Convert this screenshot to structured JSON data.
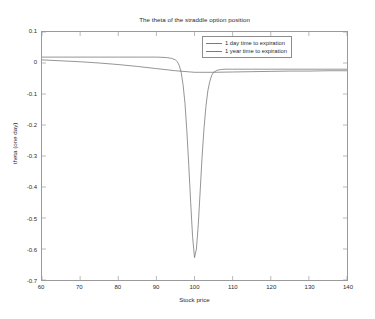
{
  "chart_data": {
    "type": "line",
    "title": "The theta of the straddle option position",
    "xlabel": "Stock price",
    "ylabel": "theta (one day)",
    "xlim": [
      60,
      140
    ],
    "ylim": [
      -0.7,
      0.1
    ],
    "xticks": [
      60,
      70,
      80,
      90,
      100,
      110,
      120,
      130,
      140
    ],
    "xtick_labels": [
      "60",
      "70",
      "80",
      "90",
      "100",
      "110",
      "120",
      "130",
      "140"
    ],
    "yticks": [
      0.1,
      0,
      -0.1,
      -0.2,
      -0.3,
      -0.4,
      -0.5,
      -0.6,
      -0.7
    ],
    "ytick_labels": [
      "0.1",
      "0",
      "-0.1",
      "-0.2",
      "-0.3",
      "-0.4",
      "-0.5",
      "-0.6",
      "-0.7"
    ],
    "grid": false,
    "legend_position": "top-right",
    "line_color": "#7a7a7a",
    "axis_color": "#9a9a9a",
    "background_color": "#ffffff",
    "series": [
      {
        "name": "1 day time to expiration",
        "color": "#7a7a7a",
        "x": [
          60,
          65,
          70,
          75,
          80,
          85,
          88,
          90,
          92,
          93,
          94,
          95,
          95.5,
          96,
          96.5,
          97,
          97.5,
          98,
          98.5,
          99,
          99.5,
          100,
          100.5,
          101,
          101.5,
          102,
          102.5,
          103,
          103.5,
          104,
          104.5,
          105,
          106,
          107,
          108,
          110,
          115,
          120,
          125,
          130,
          135,
          140
        ],
        "y": [
          0.019,
          0.019,
          0.019,
          0.019,
          0.019,
          0.019,
          0.019,
          0.019,
          0.018,
          0.017,
          0.015,
          0.01,
          0.004,
          -0.008,
          -0.03,
          -0.07,
          -0.13,
          -0.22,
          -0.33,
          -0.45,
          -0.56,
          -0.628,
          -0.6,
          -0.52,
          -0.41,
          -0.3,
          -0.21,
          -0.14,
          -0.09,
          -0.06,
          -0.04,
          -0.03,
          -0.023,
          -0.021,
          -0.02,
          -0.02,
          -0.02,
          -0.02,
          -0.02,
          -0.02,
          -0.02,
          -0.02
        ]
      },
      {
        "name": "1 year time to expiration",
        "color": "#7a7a7a",
        "x": [
          60,
          65,
          70,
          75,
          80,
          85,
          90,
          95,
          97,
          99,
          100,
          101,
          103,
          105,
          110,
          115,
          120,
          125,
          130,
          135,
          140
        ],
        "y": [
          0.01,
          0.007,
          0.004,
          0.0,
          -0.005,
          -0.011,
          -0.018,
          -0.025,
          -0.027,
          -0.029,
          -0.03,
          -0.03,
          -0.03,
          -0.03,
          -0.029,
          -0.028,
          -0.027,
          -0.026,
          -0.026,
          -0.025,
          -0.025
        ]
      }
    ]
  },
  "legend": {
    "items": [
      {
        "label": "1 day time to expiration"
      },
      {
        "label": "1 year time to expiration"
      }
    ]
  }
}
